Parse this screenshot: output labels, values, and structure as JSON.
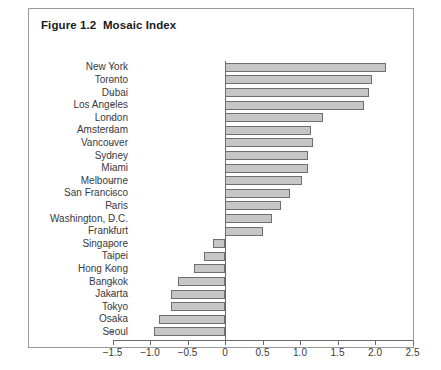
{
  "figure": {
    "title": "Figure 1.2  Mosaic Index"
  },
  "chart_data": {
    "type": "bar",
    "orientation": "horizontal",
    "title": "Figure 1.2  Mosaic Index",
    "xlabel": "",
    "ylabel": "",
    "xlim": [
      -1.5,
      2.5
    ],
    "xticks": [
      -1.5,
      -1.0,
      -0.5,
      0,
      0.5,
      1.0,
      1.5,
      2.0,
      2.5
    ],
    "xtick_labels": [
      "−1.5",
      "−1.0",
      "−0.5",
      "0",
      "0.5",
      "1.0",
      "1.5",
      "2.0",
      "2.5"
    ],
    "grid": false,
    "legend": null,
    "bar_fill_color": "#c6c6c6",
    "bar_edge_color": "#6f6f6f",
    "categories": [
      "New York",
      "Toronto",
      "Dubai",
      "Los Angeles",
      "London",
      "Amsterdam",
      "Vancouver",
      "Sydney",
      "Miami",
      "Melbourne",
      "San Francisco",
      "Paris",
      "Washington, D.C.",
      "Frankfurt",
      "Singapore",
      "Taipei",
      "Hong Kong",
      "Bangkok",
      "Jakarta",
      "Tokyo",
      "Osaka",
      "Seoul"
    ],
    "values": [
      2.15,
      1.96,
      1.92,
      1.85,
      1.31,
      1.15,
      1.17,
      1.11,
      1.1,
      1.02,
      0.87,
      0.75,
      0.62,
      0.51,
      -0.16,
      -0.28,
      -0.41,
      -0.63,
      -0.72,
      -0.72,
      -0.88,
      -0.95
    ]
  }
}
